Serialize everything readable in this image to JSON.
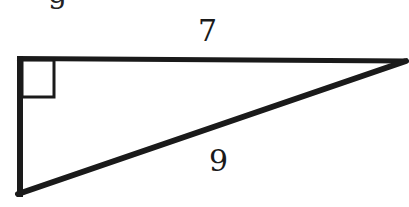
{
  "header": {
    "partial_text": "g"
  },
  "diagram": {
    "type": "right-triangle",
    "stroke_color": "#1a1a1a",
    "vertices": {
      "top_left": [
        20,
        58
      ],
      "top_right": [
        405,
        61
      ],
      "bottom_left": [
        20,
        195
      ]
    },
    "right_angle_marker": "top_left",
    "labels": {
      "top_side": "7",
      "hypotenuse": "9"
    }
  }
}
